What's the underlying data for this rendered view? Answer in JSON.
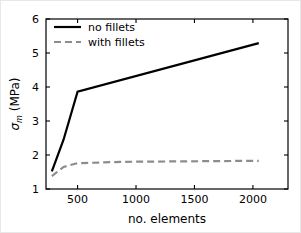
{
  "chart_data": {
    "type": "line",
    "title": "",
    "xlabel": "no. elements",
    "ylabel": "σₘ (MPa)",
    "ylabel_parts": {
      "symbol": "σ",
      "subscript": "m",
      "unit": "(MPa)"
    },
    "xlim": [
      230,
      2300
    ],
    "ylim": [
      1,
      6
    ],
    "xticks": [
      500,
      1000,
      1500,
      2000
    ],
    "xtick_labels": [
      "500",
      "1000",
      "1500",
      "2000"
    ],
    "yticks": [
      1,
      2,
      3,
      4,
      5,
      6
    ],
    "ytick_labels": [
      "1",
      "2",
      "3",
      "4",
      "5",
      "6"
    ],
    "grid": false,
    "legend_position": "upper left",
    "series": [
      {
        "name": "no fillets",
        "style": "solid",
        "color": "#000000",
        "width": 2.2,
        "x": [
          280,
          380,
          500,
          2050
        ],
        "values": [
          1.52,
          2.45,
          3.86,
          5.29
        ]
      },
      {
        "name": "with fillets",
        "style": "dashed",
        "color": "#8c8c8c",
        "width": 2.2,
        "x": [
          280,
          380,
          500,
          900,
          2050
        ],
        "values": [
          1.38,
          1.65,
          1.76,
          1.8,
          1.83
        ]
      }
    ]
  },
  "legend": {
    "items": [
      {
        "label": "no fillets"
      },
      {
        "label": "with fillets"
      }
    ]
  },
  "axes": {
    "x_title": "no. elements",
    "y_symbol": "σ",
    "y_subscript": "m",
    "y_unit": "(MPa)",
    "xtick_labels": [
      "500",
      "1000",
      "1500",
      "2000"
    ],
    "ytick_labels": [
      "1",
      "2",
      "3",
      "4",
      "5",
      "6"
    ]
  },
  "colors": {
    "no_fillets": "#000000",
    "with_fillets": "#8c8c8c",
    "axis": "#000000",
    "background": "#ffffff"
  }
}
